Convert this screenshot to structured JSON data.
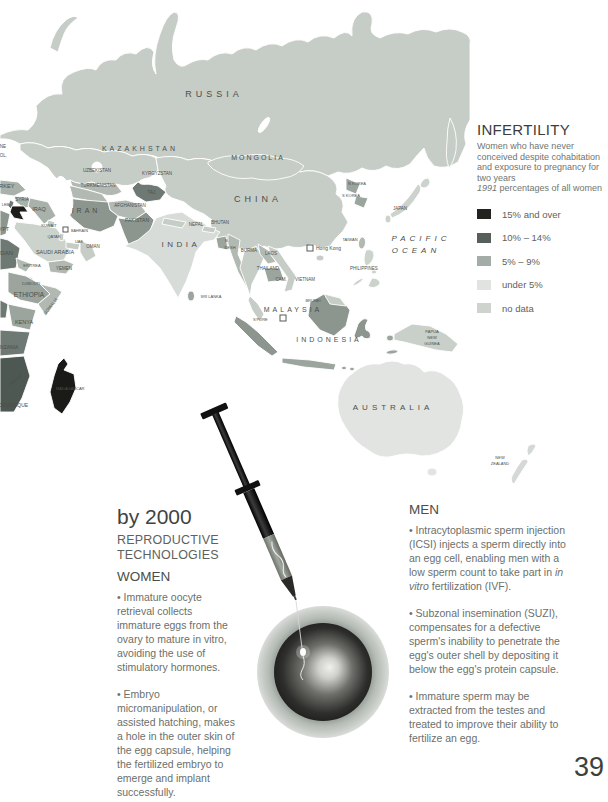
{
  "page": {
    "number": "39"
  },
  "legend": {
    "title": "INFERTILITY",
    "description": "Women who have never conceived despite cohabitation and exposure to pregnancy for two years",
    "note_html": "<i>1991</i> percentages of all women",
    "items": [
      {
        "label": "15% and over",
        "color": "#22221f"
      },
      {
        "label": "10% – 14%",
        "color": "#575f5a"
      },
      {
        "label": "5% – 9%",
        "color": "#a3aca6"
      },
      {
        "label": "under 5%",
        "color": "#e0e3df"
      },
      {
        "label": "no data",
        "color": "#ced3cd"
      }
    ]
  },
  "sections": {
    "heading": {
      "line1": "by 2000",
      "line2": "REPRODUCTIVE",
      "line3": "TECHNOLOGIES"
    },
    "women": {
      "title": "WOMEN",
      "bullets": [
        "• Immature oocyte retrieval collects immature eggs from the ovary to mature in vitro, avoiding the use of stimulatory hormones.",
        "• Embryo micromanipulation, or assisted hatching, makes a hole in the outer skin of the egg capsule, helping the fertilized embryo to emerge and implant successfully."
      ]
    },
    "men": {
      "title": "MEN",
      "bullets_html": [
        "• Intracytoplasmic sperm injection (ICSI) injects a sperm directly into an egg cell, enabling men with a low sperm count to take part in <i>in vitro</i> fertilization (IVF).",
        "• Subzonal insemination (SUZI), compensates for a defective sperm's inability to penetrate the egg's outer shell by depositing it below the egg's protein capsule.",
        "• Immature sperm may be extracted from the testes and treated to improve their ability to fertilize an egg."
      ]
    }
  },
  "map": {
    "ocean_color": "#ffffff",
    "labels": [
      {
        "t": "RUSSIA",
        "x": 214,
        "y": 97,
        "s": 9,
        "ls": 4
      },
      {
        "t": "KAZAKHSTAN",
        "x": 140,
        "y": 151,
        "s": 7,
        "ls": 3
      },
      {
        "t": "MONGOLIA",
        "x": 258,
        "y": 160,
        "s": 7,
        "ls": 2
      },
      {
        "t": "CHINA",
        "x": 258,
        "y": 202,
        "s": 9,
        "ls": 4
      },
      {
        "t": "UZBEKISTAN",
        "x": 97,
        "y": 172,
        "s": 4.5
      },
      {
        "t": "KYRGYZSTAN",
        "x": 157,
        "y": 175,
        "s": 4.5
      },
      {
        "t": "TURKMENISTAN",
        "x": 98,
        "y": 187,
        "s": 4.5
      },
      {
        "t": "TAJ.",
        "x": 152,
        "y": 194,
        "s": 4.5
      },
      {
        "t": "AFGHANISTAN",
        "x": 130,
        "y": 207,
        "s": 4.5
      },
      {
        "t": "PAKISTAN",
        "x": 137,
        "y": 222,
        "s": 5
      },
      {
        "t": "IRAN",
        "x": 86,
        "y": 213,
        "s": 7,
        "ls": 3
      },
      {
        "t": "IRAQ",
        "x": 39,
        "y": 211,
        "s": 5.5
      },
      {
        "t": "SYRIA",
        "x": 22,
        "y": 201,
        "s": 4.5
      },
      {
        "t": "LEB.",
        "x": 6,
        "y": 206,
        "s": 4
      },
      {
        "t": "TURKEY",
        "x": -8,
        "y": 188,
        "s": 5.5,
        "a": "s"
      },
      {
        "t": "UKRAINE",
        "x": -14,
        "y": 148,
        "s": 4.5,
        "a": "s"
      },
      {
        "t": "MOL.",
        "x": -4,
        "y": 157,
        "s": 4.5,
        "a": "s"
      },
      {
        "t": "KUWAIT",
        "x": 49,
        "y": 227,
        "s": 4
      },
      {
        "t": "QATAR",
        "x": 54,
        "y": 238,
        "s": 4
      },
      {
        "t": "BAHRAIN",
        "x": 71,
        "y": 232,
        "s": 3.8,
        "a": "s"
      },
      {
        "t": "UAE",
        "x": 79,
        "y": 243,
        "s": 4
      },
      {
        "t": "OMAN",
        "x": 93,
        "y": 248,
        "s": 4.5
      },
      {
        "t": "SAUDI ARABIA",
        "x": 55,
        "y": 254,
        "s": 5.5
      },
      {
        "t": "YEMEN",
        "x": 64,
        "y": 270,
        "s": 4.5
      },
      {
        "t": "EGYPT",
        "x": -8,
        "y": 231,
        "s": 5,
        "a": "s"
      },
      {
        "t": "SUDAN",
        "x": -8,
        "y": 255,
        "s": 6,
        "a": "s"
      },
      {
        "t": "ERITREA",
        "x": 32,
        "y": 267,
        "s": 4
      },
      {
        "t": "DJIBOUTI",
        "x": 31,
        "y": 285,
        "s": 4
      },
      {
        "t": "ETHIOPIA",
        "x": 29,
        "y": 297,
        "s": 6.5
      },
      {
        "t": "SOMALIA",
        "x": 52,
        "y": 307,
        "s": 4.5,
        "r": -52
      },
      {
        "t": "KENYA",
        "x": 24,
        "y": 324,
        "s": 5.5
      },
      {
        "t": "TANZANIA",
        "x": -6,
        "y": 349,
        "s": 5,
        "a": "s"
      },
      {
        "t": "MALAWI",
        "x": 16,
        "y": 381,
        "s": 4,
        "r": -40
      },
      {
        "t": "MOZAMBIQUE",
        "x": -6,
        "y": 407,
        "s": 5,
        "a": "s"
      },
      {
        "t": "MADAGASCAR",
        "x": 56,
        "y": 390,
        "s": 4,
        "a": "s"
      },
      {
        "t": "NEPAL",
        "x": 196,
        "y": 226,
        "s": 4.5
      },
      {
        "t": "BHUTAN",
        "x": 220,
        "y": 224,
        "s": 4.5
      },
      {
        "t": "B.",
        "x": 227,
        "y": 242,
        "s": 4
      },
      {
        "t": "DESH",
        "x": 230,
        "y": 249,
        "s": 4
      },
      {
        "t": "INDIA",
        "x": 181,
        "y": 247,
        "s": 8,
        "ls": 3.5
      },
      {
        "t": "SRI LANKA",
        "x": 211,
        "y": 298,
        "s": 4
      },
      {
        "t": "BURMA",
        "x": 249,
        "y": 252,
        "s": 4.5
      },
      {
        "t": "LAOS",
        "x": 271,
        "y": 255,
        "s": 4.5
      },
      {
        "t": "THAILAND",
        "x": 268,
        "y": 270,
        "s": 4.5
      },
      {
        "t": "CAM.",
        "x": 281,
        "y": 281,
        "s": 4.5
      },
      {
        "t": "VIETNAM",
        "x": 305,
        "y": 281,
        "s": 4.5
      },
      {
        "t": "TAIWAN",
        "x": 350,
        "y": 241,
        "s": 4
      },
      {
        "t": "Hong Kong",
        "x": 316,
        "y": 250,
        "s": 5,
        "a": "s"
      },
      {
        "t": "PHILIPPINES",
        "x": 364,
        "y": 270,
        "s": 4.5
      },
      {
        "t": "MALAYSIA",
        "x": 293,
        "y": 312,
        "s": 7,
        "ls": 3
      },
      {
        "t": "BRUNEI",
        "x": 313,
        "y": 302,
        "s": 4
      },
      {
        "t": "S'PORE",
        "x": 253,
        "y": 321,
        "s": 4,
        "a": "s"
      },
      {
        "t": "INDONESIA",
        "x": 329,
        "y": 342,
        "s": 7,
        "ls": 3
      },
      {
        "t": "PAPUA",
        "x": 432,
        "y": 333,
        "s": 4
      },
      {
        "t": "NEW",
        "x": 432,
        "y": 339,
        "s": 4
      },
      {
        "t": "GUINEA",
        "x": 432,
        "y": 345,
        "s": 4
      },
      {
        "t": "AUSTRALIA",
        "x": 393,
        "y": 410,
        "s": 8,
        "ls": 4
      },
      {
        "t": "NEW",
        "x": 500,
        "y": 459,
        "s": 4
      },
      {
        "t": "ZEALAND",
        "x": 500,
        "y": 465,
        "s": 4
      },
      {
        "t": "N KOREA",
        "x": 357,
        "y": 185,
        "s": 4
      },
      {
        "t": "S KOREA",
        "x": 351,
        "y": 197,
        "s": 4
      },
      {
        "t": "JAPAN",
        "x": 400,
        "y": 210,
        "s": 4.5
      },
      {
        "t": "PACIFIC",
        "x": 421,
        "y": 241,
        "s": 8,
        "ls": 4,
        "i": 1,
        "c": "#70756f"
      },
      {
        "t": "OCEAN",
        "x": 416,
        "y": 253,
        "s": 8,
        "ls": 4,
        "i": 1,
        "c": "#70756f"
      }
    ],
    "symbols": [
      {
        "name": "hong-kong-marker",
        "x": 307,
        "y": 245,
        "w": 6
      },
      {
        "name": "singapore-marker",
        "x": 280,
        "y": 315,
        "w": 6
      },
      {
        "name": "bahrain-marker",
        "x": 63,
        "y": 227,
        "w": 5
      }
    ]
  }
}
